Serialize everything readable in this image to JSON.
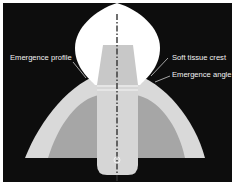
{
  "diagram": {
    "type": "dental implant cross-section",
    "labels": {
      "emergence_profile": "Emergence profile",
      "soft_tissue_crest": "Soft tissue crest",
      "emergence_angle": "Emergence angle"
    },
    "colors": {
      "background": "#0d0d0d",
      "crown": "#ffffff",
      "soft_tissue_outer": "#d9d9d9",
      "bone_inner": "#a6a6a6",
      "abutment": "#c8c8c8",
      "implant": "#d6d6d6",
      "axis": "#333333"
    }
  }
}
